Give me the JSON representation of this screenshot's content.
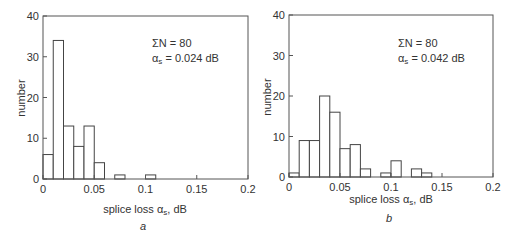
{
  "chart_data": [
    {
      "type": "bar",
      "panel_label": "a",
      "title": "",
      "xlabel": "splice loss αs, dB",
      "xlabel_main": "splice loss α",
      "xlabel_sub": "s",
      "xlabel_unit": ", dB",
      "ylabel": "number",
      "xlim": [
        0,
        0.2
      ],
      "ylim": [
        0,
        40
      ],
      "xticks": [
        "0",
        "0.05",
        "0.1",
        "0.15",
        "0.2"
      ],
      "yticks": [
        "0",
        "10",
        "20",
        "30",
        "40"
      ],
      "bin_width": 0.01,
      "bins": [
        {
          "from": 0.0,
          "to": 0.01,
          "count": 6
        },
        {
          "from": 0.01,
          "to": 0.02,
          "count": 34
        },
        {
          "from": 0.02,
          "to": 0.03,
          "count": 13
        },
        {
          "from": 0.03,
          "to": 0.04,
          "count": 8
        },
        {
          "from": 0.04,
          "to": 0.05,
          "count": 13
        },
        {
          "from": 0.05,
          "to": 0.06,
          "count": 4
        },
        {
          "from": 0.07,
          "to": 0.08,
          "count": 1
        },
        {
          "from": 0.1,
          "to": 0.11,
          "count": 1
        }
      ],
      "annotation": {
        "sum_label": "ΣN = 80",
        "mean_label_main": "α",
        "mean_label_sub": "s",
        "mean_label_value": " = 0.024 dB"
      },
      "grid": false,
      "legend": "none"
    },
    {
      "type": "bar",
      "panel_label": "b",
      "title": "",
      "xlabel": "splice loss αs, dB",
      "xlabel_main": "splice loss α",
      "xlabel_sub": "s",
      "xlabel_unit": ", dB",
      "ylabel": "number",
      "xlim": [
        0,
        0.2
      ],
      "ylim": [
        0,
        40
      ],
      "xticks": [
        "0",
        "0.05",
        "0.1",
        "0.15",
        "0.2"
      ],
      "yticks": [
        "0",
        "10",
        "20",
        "30",
        "40"
      ],
      "bin_width": 0.01,
      "bins": [
        {
          "from": 0.0,
          "to": 0.01,
          "count": 1
        },
        {
          "from": 0.01,
          "to": 0.02,
          "count": 9
        },
        {
          "from": 0.02,
          "to": 0.03,
          "count": 9
        },
        {
          "from": 0.03,
          "to": 0.04,
          "count": 20
        },
        {
          "from": 0.04,
          "to": 0.05,
          "count": 16
        },
        {
          "from": 0.05,
          "to": 0.06,
          "count": 7
        },
        {
          "from": 0.06,
          "to": 0.07,
          "count": 8
        },
        {
          "from": 0.07,
          "to": 0.08,
          "count": 2
        },
        {
          "from": 0.09,
          "to": 0.1,
          "count": 1
        },
        {
          "from": 0.1,
          "to": 0.11,
          "count": 4
        },
        {
          "from": 0.12,
          "to": 0.13,
          "count": 2
        },
        {
          "from": 0.13,
          "to": 0.14,
          "count": 1
        }
      ],
      "annotation": {
        "sum_label": "ΣN = 80",
        "mean_label_main": "α",
        "mean_label_sub": "s",
        "mean_label_value": " = 0.042 dB"
      },
      "grid": false,
      "legend": "none"
    }
  ]
}
